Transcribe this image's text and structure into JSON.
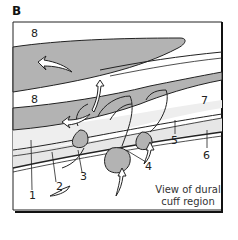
{
  "panel_letter": "B",
  "labels": {
    "l1": "1",
    "l2": "2",
    "l3": "3",
    "l4": "4",
    "l5": "5",
    "l6": "6",
    "l7": "7",
    "l8a": "8",
    "l8b": "8"
  },
  "caption": {
    "line1": "View of dural",
    "line2": "cuff region"
  },
  "colors": {
    "shaded": "#b3b3b3",
    "stipple": "#e6e6e6",
    "line": "#222222",
    "background": "#ffffff"
  }
}
